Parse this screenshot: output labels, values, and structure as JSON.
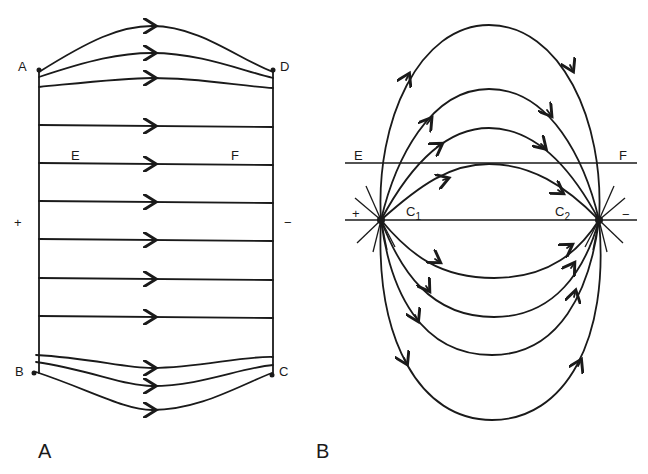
{
  "panel_a": {
    "corner_a": "A",
    "corner_b": "B",
    "corner_c": "C",
    "corner_d": "D",
    "line_e": "E",
    "line_f": "F",
    "plus": "+",
    "minus": "−",
    "caption": "A"
  },
  "panel_b": {
    "line_e": "E",
    "line_f": "F",
    "electrode_1": "C",
    "electrode_1_sub": "1",
    "electrode_2": "C",
    "electrode_2_sub": "2",
    "plus": "+",
    "minus": "−",
    "caption": "B"
  }
}
